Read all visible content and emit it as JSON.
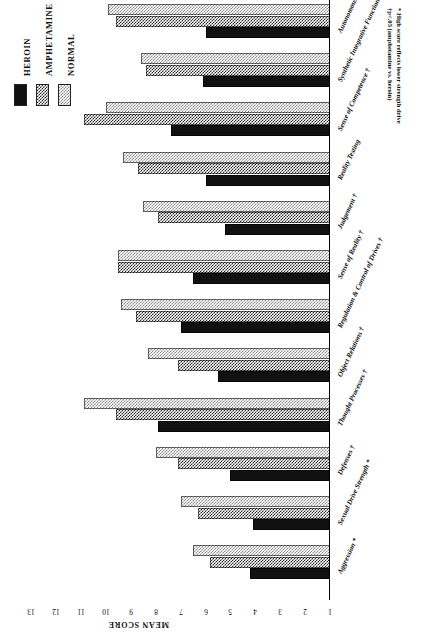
{
  "legend": {
    "title": "",
    "items": [
      {
        "label": "HEROIN",
        "swatch": "solid-black",
        "color": "#111111"
      },
      {
        "label": "AMPHETAMINE",
        "swatch": "dark-checker",
        "color": "#2b2b2b"
      },
      {
        "label": "NORMAL",
        "swatch": "light-checker",
        "color": "#8f8f8f"
      }
    ]
  },
  "axis": {
    "title": "MEAN SCORE",
    "ticks": [
      "13",
      "12",
      "11",
      "10",
      "9",
      "8",
      "7",
      "6",
      "5",
      "4",
      "3",
      "2",
      "1"
    ]
  },
  "footnote": {
    "line1": "* High score reflects lower strength drive",
    "line2": "†p<.05 (amphetamine vs. heroin)"
  },
  "chart_data": {
    "type": "bar",
    "title": "",
    "xlabel": "MEAN SCORE",
    "ylabel": "",
    "orientation": "horizontal",
    "xlim": [
      1,
      13
    ],
    "grid": false,
    "legend_position": "top-left",
    "categories": [
      "Autonomous Functioning †",
      "Synthetic Integrative Functioning †",
      "Sense of Competence †",
      "Reality Testing",
      "Judgement †",
      "Sense of Reality †",
      "Regulation & Control of Drives †",
      "Object Relations †",
      "Thought Processes †",
      "Defenses †",
      "Sexual Drive Strength *",
      "Aggression *"
    ],
    "series": [
      {
        "name": "HEROIN",
        "values": [
          6.0,
          6.1,
          7.4,
          6.0,
          5.2,
          6.5,
          7.0,
          5.5,
          7.9,
          5.0,
          4.1,
          4.2
        ]
      },
      {
        "name": "AMPHETAMINE",
        "values": [
          9.6,
          8.4,
          10.9,
          8.7,
          7.9,
          9.5,
          8.8,
          7.1,
          9.6,
          7.1,
          6.3,
          5.8
        ]
      },
      {
        "name": "NORMAL",
        "values": [
          9.9,
          8.6,
          10.0,
          9.3,
          8.5,
          9.5,
          9.4,
          8.3,
          10.9,
          8.0,
          7.0,
          6.5
        ]
      }
    ]
  }
}
